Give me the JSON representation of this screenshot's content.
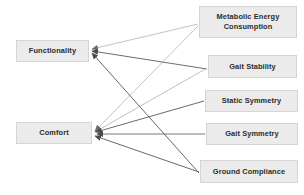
{
  "diagram": {
    "type": "node-link-influence-diagram",
    "node_fill_color": "#ebebeb",
    "node_border_color": "#d5d5d5",
    "node_text_color": "#2b2b2b",
    "background_color": "#ffffff",
    "edge_color_dark": "#555555",
    "edge_color_light": "#b9b9b9",
    "left_nodes": [
      {
        "id": "functionality",
        "label": "Functionality",
        "x": 16,
        "y": 40,
        "w": 73,
        "h": 22
      },
      {
        "id": "comfort",
        "label": "Comfort",
        "x": 16,
        "y": 122,
        "w": 76,
        "h": 22
      }
    ],
    "right_nodes": [
      {
        "id": "metabolic-energy-consumption",
        "label": "Metabolic Energy Consumption",
        "line1": "Metabolic Energy",
        "line2": "Consumption",
        "x": 199,
        "y": 6,
        "w": 98,
        "h": 32
      },
      {
        "id": "gait-stability",
        "label": "Gait Stability",
        "x": 208,
        "y": 55,
        "w": 89,
        "h": 23
      },
      {
        "id": "static-symmetry",
        "label": "Static Symmetry",
        "x": 205,
        "y": 90,
        "w": 93,
        "h": 22
      },
      {
        "id": "gait-symmetry",
        "label": "Gait Symmetry",
        "x": 206,
        "y": 123,
        "w": 92,
        "h": 22
      },
      {
        "id": "ground-compliance",
        "label": "Ground Compliance",
        "x": 200,
        "y": 160,
        "w": 98,
        "h": 23
      }
    ],
    "edges": [
      {
        "from": "metabolic-energy-consumption",
        "to": "functionality",
        "shade": "light"
      },
      {
        "from": "metabolic-energy-consumption",
        "to": "comfort",
        "shade": "light"
      },
      {
        "from": "gait-stability",
        "to": "functionality",
        "shade": "dark"
      },
      {
        "from": "gait-stability",
        "to": "comfort",
        "shade": "light"
      },
      {
        "from": "static-symmetry",
        "to": "comfort",
        "shade": "dark"
      },
      {
        "from": "gait-symmetry",
        "to": "comfort",
        "shade": "dark"
      },
      {
        "from": "ground-compliance",
        "to": "functionality",
        "shade": "dark"
      },
      {
        "from": "ground-compliance",
        "to": "comfort",
        "shade": "dark"
      }
    ]
  }
}
